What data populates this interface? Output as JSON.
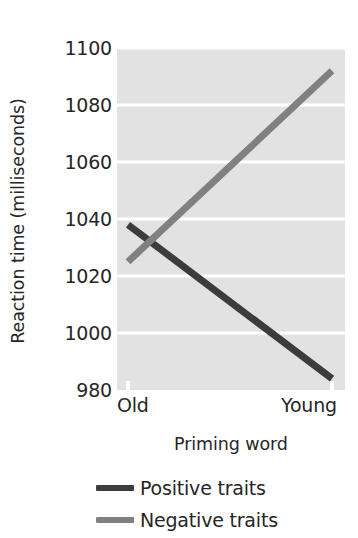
{
  "chart_data": {
    "type": "line",
    "title": "",
    "xlabel": "Priming word",
    "ylabel": "Reaction time (milliseconds)",
    "categories": [
      "Old",
      "Young"
    ],
    "xticklabels": [
      "Old",
      "Young"
    ],
    "yticklabels": [
      "1100",
      "1080",
      "1060",
      "1040",
      "1020",
      "1000",
      "980"
    ],
    "yticks": [
      1100,
      1080,
      1060,
      1040,
      1020,
      1000,
      980
    ],
    "ylim": [
      980,
      1100
    ],
    "grid": "horizontal",
    "legend_position": "below",
    "series": [
      {
        "name": "Positive traits",
        "color": "#3c3c3c",
        "values": [
          1038,
          984
        ]
      },
      {
        "name": "Negative traits",
        "color": "#808080",
        "values": [
          1025,
          1092
        ]
      }
    ]
  },
  "axis": {
    "y_title": "Reaction time (milliseconds)",
    "x_title": "Priming word",
    "y_ticks": [
      {
        "label": "1100",
        "value": 1100
      },
      {
        "label": "1080",
        "value": 1080
      },
      {
        "label": "1060",
        "value": 1060
      },
      {
        "label": "1040",
        "value": 1040
      },
      {
        "label": "1020",
        "value": 1020
      },
      {
        "label": "1000",
        "value": 1000
      },
      {
        "label": "980",
        "value": 980
      }
    ],
    "x_ticks": [
      {
        "label": "Old"
      },
      {
        "label": "Young"
      }
    ]
  },
  "legend": {
    "items": [
      {
        "label": "Positive traits",
        "color": "#3c3c3c"
      },
      {
        "label": "Negative traits",
        "color": "#808080"
      }
    ]
  },
  "style": {
    "plot_background": "#e2e2e2",
    "gridline_color": "#ffffff",
    "figure_background": "#ffffff",
    "text_color": "#262626"
  }
}
